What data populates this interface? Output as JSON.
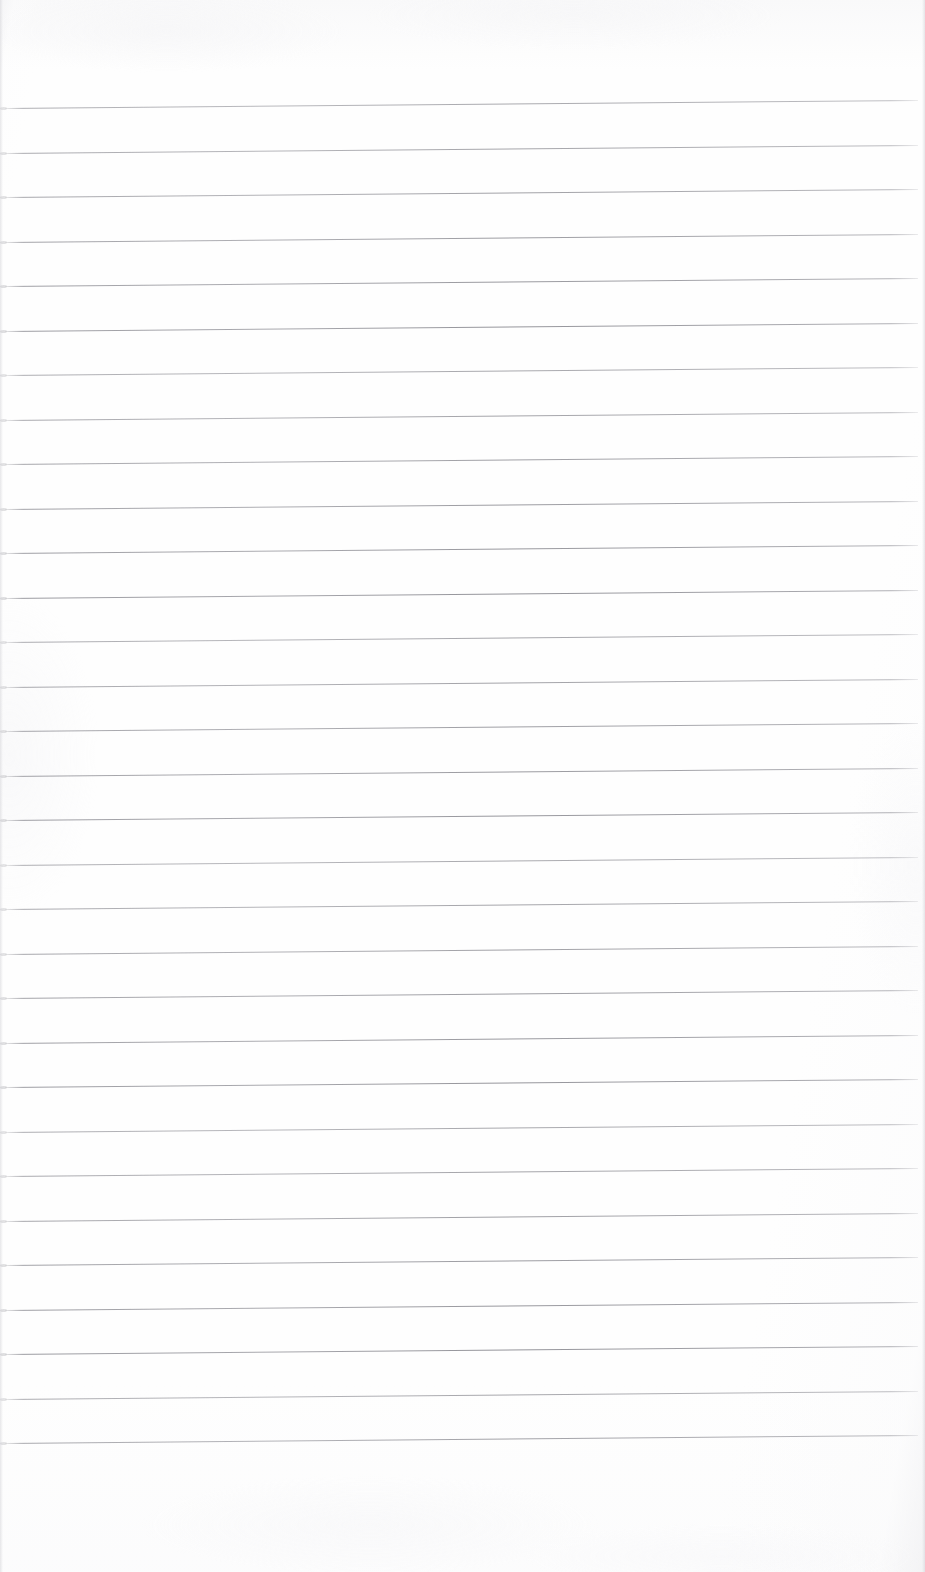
{
  "document": {
    "kind": "lined-paper-scan",
    "title": "Blank ruled notebook page",
    "page_width": 925,
    "page_height": 1572,
    "paper_color": "#fefefe",
    "rule_color": "#96969c",
    "edge_shadow_color": "#d4d4d8",
    "content_text": "",
    "written_text_present": "no"
  },
  "ruling": {
    "line_count": 31,
    "first_line_y": 108,
    "line_spacing": 44.5,
    "line_thickness": 1,
    "line_start_x": 5,
    "line_end_x": 918,
    "slope_rise_px": -8,
    "top_margin": 108,
    "bottom_margin": 105,
    "lines_y": [
      108,
      152.5,
      197,
      241.5,
      286,
      330.5,
      375,
      419.5,
      464,
      508.5,
      553,
      597.5,
      642,
      686.5,
      731,
      775.5,
      820,
      864.5,
      909,
      953.5,
      998,
      1042.5,
      1087,
      1131.5,
      1176,
      1220.5,
      1265,
      1309.5,
      1354,
      1398.5,
      1443
    ]
  },
  "regions": {
    "header_blank_label": "",
    "footer_blank_label": ""
  }
}
